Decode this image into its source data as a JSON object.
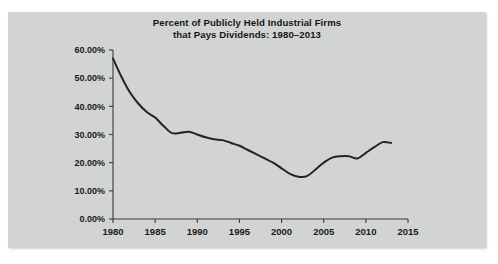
{
  "figure": {
    "background_color": "#d2d3d3",
    "page_color": "#ffffff"
  },
  "chart_data": {
    "type": "line",
    "title": "Percent of Publicly Held Industrial Firms that Pays Dividends: 1980–2013",
    "title_line1": "Percent of Publicly Held Industrial Firms",
    "title_line2": "that Pays Dividends: 1980–2013",
    "xlabel": "",
    "ylabel": "",
    "grid": false,
    "legend": "none",
    "line_color": "#232323",
    "xlim": [
      1980,
      2015
    ],
    "ylim": [
      0,
      60
    ],
    "xticks": [
      1980,
      1985,
      1990,
      1995,
      2000,
      2005,
      2010,
      2015
    ],
    "xtick_labels": [
      "1980",
      "1985",
      "1990",
      "1995",
      "2000",
      "2005",
      "2010",
      "2015"
    ],
    "yticks": [
      0,
      10,
      20,
      30,
      40,
      50,
      60
    ],
    "ytick_labels": [
      "0.00%",
      "10.00%",
      "20.00%",
      "30.00%",
      "40.00%",
      "50.00%",
      "60.00%"
    ],
    "series": [
      {
        "name": "Percent of firms paying dividends",
        "x": [
          1980,
          1981,
          1982,
          1983,
          1984,
          1985,
          1986,
          1987,
          1988,
          1989,
          1990,
          1991,
          1992,
          1993,
          1994,
          1995,
          1996,
          1997,
          1998,
          1999,
          2000,
          2001,
          2002,
          2003,
          2004,
          2005,
          2006,
          2007,
          2008,
          2009,
          2010,
          2011,
          2012,
          2013
        ],
        "values": [
          57.0,
          50.5,
          45.0,
          41.0,
          38.0,
          36.0,
          33.0,
          30.5,
          30.6,
          31.0,
          30.0,
          29.0,
          28.3,
          28.0,
          27.0,
          26.0,
          24.5,
          23.0,
          21.5,
          20.0,
          18.0,
          16.0,
          15.0,
          15.2,
          17.5,
          20.0,
          21.8,
          22.3,
          22.3,
          21.5,
          23.5,
          25.5,
          27.3,
          27.0
        ]
      }
    ]
  }
}
